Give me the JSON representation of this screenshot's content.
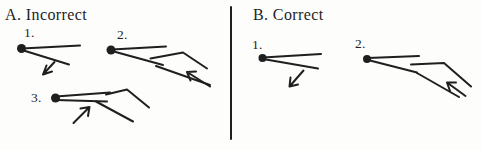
{
  "colors": {
    "ink": "#1f1f1f",
    "background": "#fdfdfc"
  },
  "panels": {
    "incorrect": {
      "heading": "A. Incorrect",
      "items": [
        {
          "label": "1."
        },
        {
          "label": "2."
        },
        {
          "label": "3."
        }
      ]
    },
    "correct": {
      "heading": "B. Correct",
      "items": [
        {
          "label": "1."
        },
        {
          "label": "2."
        }
      ]
    }
  }
}
